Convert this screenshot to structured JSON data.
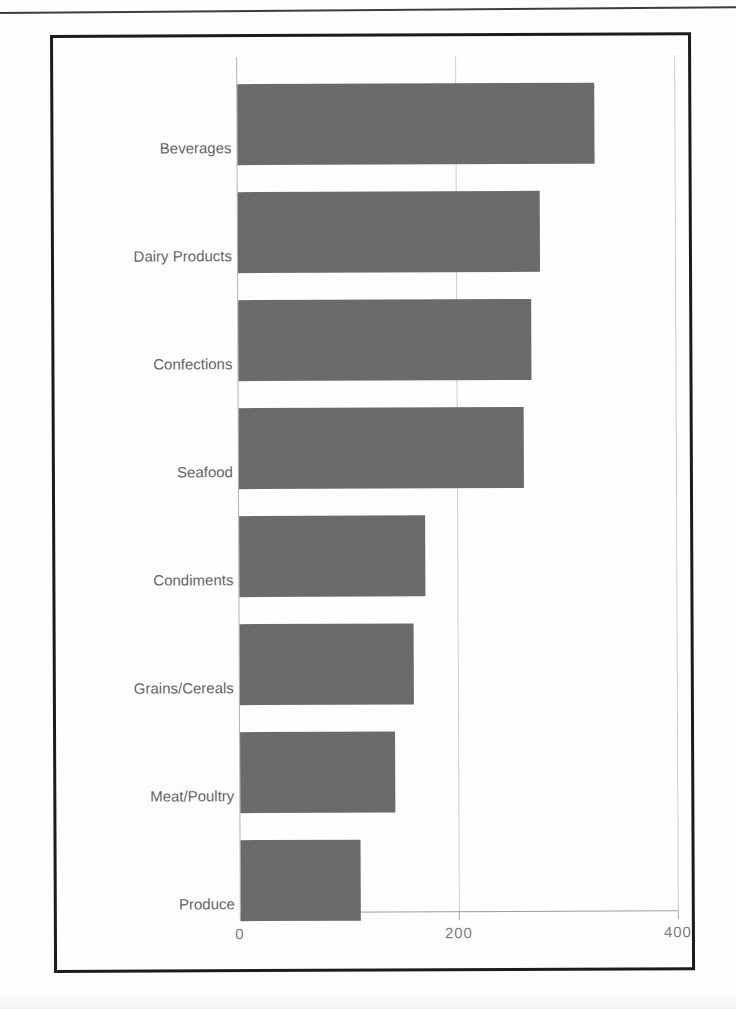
{
  "chart_data": {
    "type": "bar",
    "orientation": "horizontal",
    "title": "",
    "xlabel": "",
    "ylabel": "",
    "categories": [
      "Beverages",
      "Dairy Products",
      "Confections",
      "Seafood",
      "Condiments",
      "Grains/Cereals",
      "Meat/Poultry",
      "Produce"
    ],
    "values": [
      359,
      303,
      294,
      286,
      187,
      175,
      156,
      121
    ],
    "xlim": [
      0,
      440
    ],
    "xticks": [
      0,
      200,
      400
    ],
    "xtick_labels": [
      "0",
      "200",
      "400"
    ],
    "grid": true,
    "legend": false,
    "bar_color": "#6b6b6b"
  },
  "axis": {
    "tick_0": "0",
    "tick_200": "200",
    "tick_400": "400"
  },
  "categories": {
    "c0": "Beverages",
    "c1": "Dairy Products",
    "c2": "Confections",
    "c3": "Seafood",
    "c4": "Condiments",
    "c5": "Grains/Cereals",
    "c6": "Meat/Poultry",
    "c7": "Produce"
  }
}
